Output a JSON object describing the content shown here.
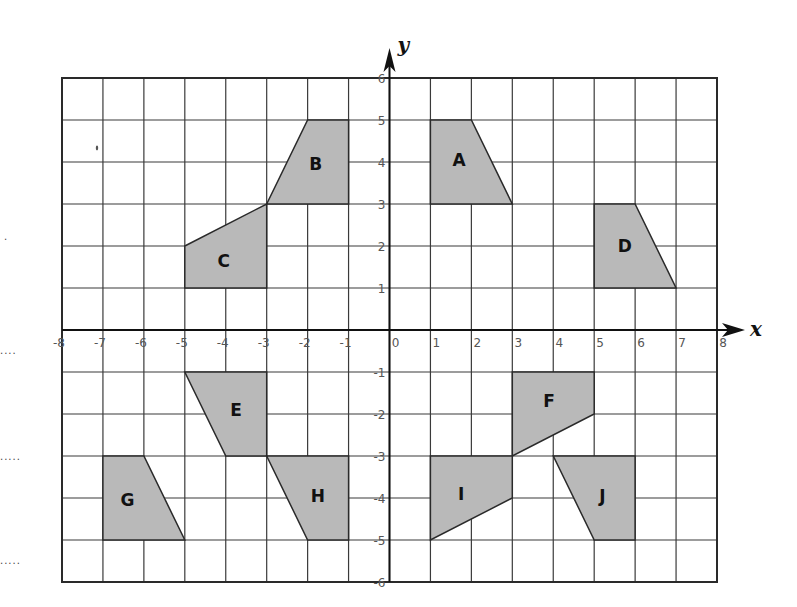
{
  "diagram": {
    "type": "coordinate-grid",
    "axes": {
      "x_label": "x",
      "y_label": "y",
      "x_range": [
        -8,
        8
      ],
      "y_range": [
        -6,
        6
      ],
      "x_ticks": [
        "-8",
        "-7",
        "-6",
        "-5",
        "-4",
        "-3",
        "-2",
        "-1",
        "0",
        "1",
        "2",
        "3",
        "4",
        "5",
        "6",
        "7",
        "8"
      ],
      "y_ticks": [
        "6",
        "5",
        "4",
        "3",
        "2",
        "1",
        "-1",
        "-2",
        "-3",
        "-4",
        "-5",
        "-6"
      ]
    },
    "colors": {
      "shape_fill": "#b9b9b9",
      "shape_stroke": "#2a2a2a",
      "grid_line": "#3a3a3a",
      "border": "#2a2a2a",
      "tick_label": "#555555"
    },
    "shapes": [
      {
        "label": "A",
        "vertices": [
          [
            1,
            5
          ],
          [
            2,
            5
          ],
          [
            3,
            3
          ],
          [
            1,
            3
          ]
        ],
        "label_at": [
          1.7,
          4.05
        ]
      },
      {
        "label": "B",
        "vertices": [
          [
            -2,
            5
          ],
          [
            -1,
            5
          ],
          [
            -1,
            3
          ],
          [
            -3,
            3
          ]
        ],
        "label_at": [
          -1.8,
          3.95
        ]
      },
      {
        "label": "C",
        "vertices": [
          [
            -5,
            2
          ],
          [
            -3,
            3
          ],
          [
            -3,
            1
          ],
          [
            -5,
            1
          ]
        ],
        "label_at": [
          -4.05,
          1.65
        ]
      },
      {
        "label": "D",
        "vertices": [
          [
            5,
            3
          ],
          [
            6,
            3
          ],
          [
            7,
            1
          ],
          [
            5,
            1
          ]
        ],
        "label_at": [
          5.75,
          2.0
        ]
      },
      {
        "label": "E",
        "vertices": [
          [
            -5,
            -1
          ],
          [
            -3,
            -1
          ],
          [
            -3,
            -3
          ],
          [
            -4,
            -3
          ]
        ],
        "label_at": [
          -3.75,
          -1.9
        ]
      },
      {
        "label": "F",
        "vertices": [
          [
            3,
            -1
          ],
          [
            5,
            -1
          ],
          [
            5,
            -2
          ],
          [
            3,
            -3
          ]
        ],
        "label_at": [
          3.9,
          -1.7
        ]
      },
      {
        "label": "G",
        "vertices": [
          [
            -7,
            -3
          ],
          [
            -6,
            -3
          ],
          [
            -5,
            -5
          ],
          [
            -7,
            -5
          ]
        ],
        "label_at": [
          -6.4,
          -4.05
        ]
      },
      {
        "label": "H",
        "vertices": [
          [
            -3,
            -3
          ],
          [
            -1,
            -3
          ],
          [
            -1,
            -5
          ],
          [
            -2,
            -5
          ]
        ],
        "label_at": [
          -1.75,
          -3.95
        ]
      },
      {
        "label": "I",
        "vertices": [
          [
            1,
            -3
          ],
          [
            3,
            -3
          ],
          [
            3,
            -4
          ],
          [
            1,
            -5
          ]
        ],
        "label_at": [
          1.75,
          -3.9
        ]
      },
      {
        "label": "J",
        "vertices": [
          [
            4,
            -3
          ],
          [
            6,
            -3
          ],
          [
            6,
            -5
          ],
          [
            5,
            -5
          ]
        ],
        "label_at": [
          5.2,
          -3.95
        ]
      }
    ]
  },
  "margin_marks": [
    {
      "text": ".",
      "x": 4,
      "y": 232
    },
    {
      "text": "....",
      "x": 0,
      "y": 346
    },
    {
      "text": ".....",
      "x": 0,
      "y": 452
    },
    {
      "text": ".....",
      "x": 0,
      "y": 556
    }
  ]
}
